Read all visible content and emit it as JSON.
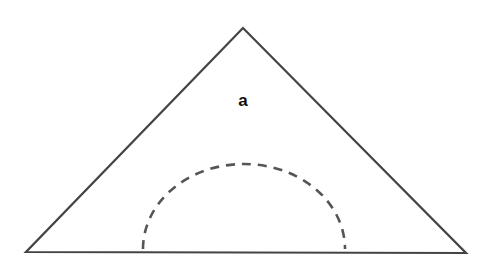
{
  "diagram": {
    "label": "a",
    "colors": {
      "background": "#ffffff",
      "outline": "#444444",
      "dashed_arc": "#555555",
      "label": "#111111"
    },
    "triangle": {
      "apex": [
        243,
        28
      ],
      "left": [
        26,
        252
      ],
      "right": [
        466,
        253
      ]
    },
    "arc": {
      "center_x": 244,
      "base_y": 249,
      "radius_x": 101,
      "radius_y": 85,
      "style": "dashed"
    }
  }
}
